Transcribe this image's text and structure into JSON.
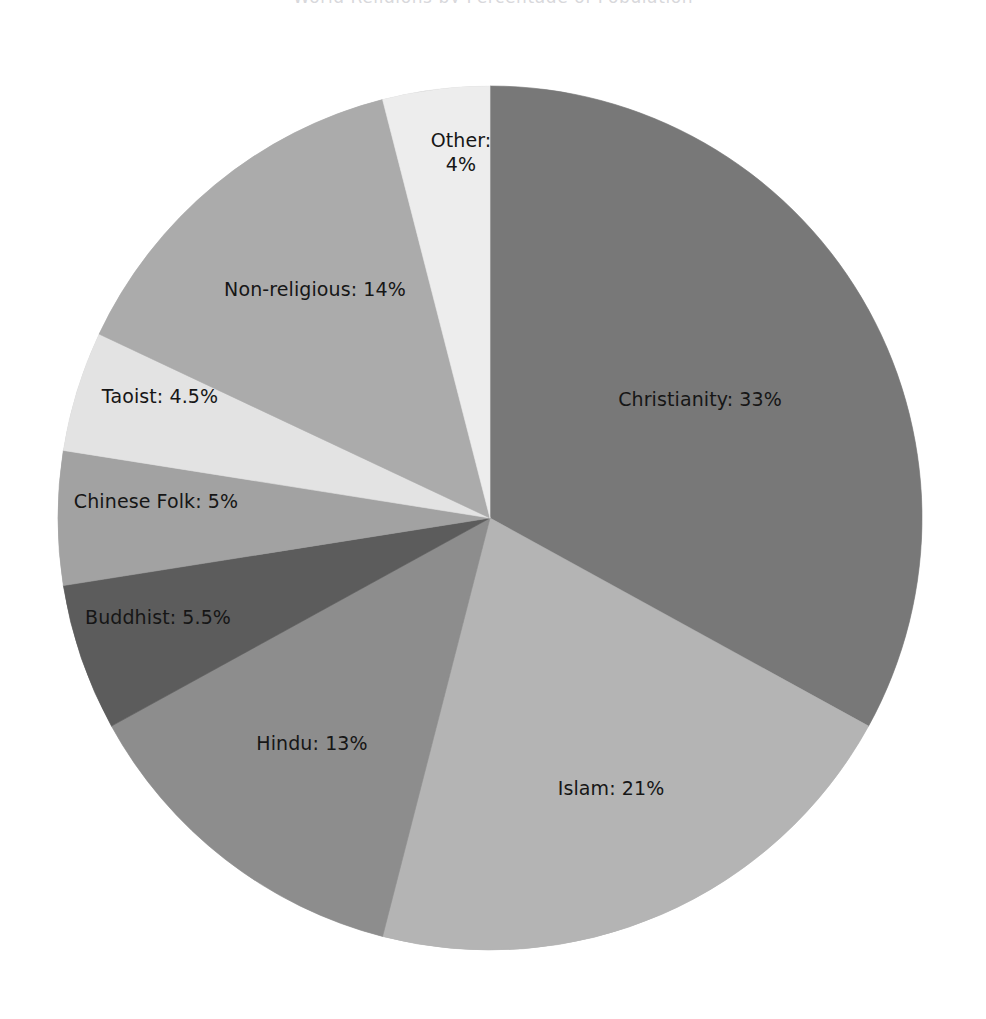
{
  "chart_data": {
    "type": "pie",
    "title": "World Religions by Percentage of Population",
    "xlabel": "",
    "ylabel": "",
    "units": "percent",
    "start_angle_deg": 0,
    "direction": "clockwise",
    "legend": "none",
    "grid": false,
    "labels_inside": true,
    "categories": [
      "Christianity",
      "Islam",
      "Hindu",
      "Buddhist",
      "Chinese Folk",
      "Taoist",
      "Non-religious",
      "Other"
    ],
    "values": [
      33,
      21,
      13,
      5.5,
      5,
      4.5,
      14,
      4
    ],
    "total": 100,
    "slices": [
      {
        "name": "Christianity",
        "value": 33,
        "value_text": "33%",
        "label": "Christianity: 33%",
        "color": "#787878",
        "label_x": 700,
        "label_y": 400,
        "two_line": false
      },
      {
        "name": "Islam",
        "value": 21,
        "value_text": "21%",
        "label": "Islam: 21%",
        "color": "#b4b4b4",
        "label_x": 611,
        "label_y": 789,
        "two_line": false
      },
      {
        "name": "Hindu",
        "value": 13,
        "value_text": "13%",
        "label": "Hindu: 13%",
        "color": "#8d8d8d",
        "label_x": 312,
        "label_y": 744,
        "two_line": false
      },
      {
        "name": "Buddhist",
        "value": 5.5,
        "value_text": "5.5%",
        "label": "Buddhist: 5.5%",
        "color": "#5c5c5c",
        "label_x": 158,
        "label_y": 618,
        "two_line": false
      },
      {
        "name": "Chinese Folk",
        "value": 5,
        "value_text": "5%",
        "label": "Chinese Folk: 5%",
        "color": "#a2a2a2",
        "label_x": 156,
        "label_y": 502,
        "two_line": false
      },
      {
        "name": "Taoist",
        "value": 4.5,
        "value_text": "4.5%",
        "label": "Taoist: 4.5%",
        "color": "#e3e3e3",
        "label_x": 160,
        "label_y": 397,
        "two_line": false
      },
      {
        "name": "Non-religious",
        "value": 14,
        "value_text": "14%",
        "label": "Non-religious: 14%",
        "color": "#ababab",
        "label_x": 315,
        "label_y": 290,
        "two_line": false
      },
      {
        "name": "Other",
        "value": 4,
        "value_text": "4%",
        "label": "Other: 4%",
        "label_line1": "Other:",
        "label_line2": "4%",
        "color": "#ededed",
        "label_x": 461,
        "label_y": 153,
        "two_line": true
      }
    ],
    "geometry": {
      "center_x": 490,
      "center_y": 518,
      "radius": 432
    },
    "background_color": "#ffffff",
    "text_color": "#161616"
  }
}
